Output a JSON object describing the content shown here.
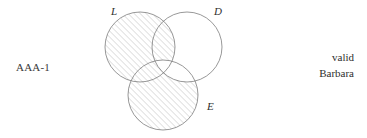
{
  "figure": {
    "left_label": "AAA-1",
    "conclusion": {
      "validity": "valid",
      "mood_figure_name": "Barbara"
    },
    "diagram": {
      "type": "three-circle-venn",
      "circles": [
        {
          "id": "L",
          "label": "L",
          "cx": 140,
          "cy": 47,
          "r": 35,
          "label_x": 111,
          "label_y": 15
        },
        {
          "id": "D",
          "label": "D",
          "cx": 187,
          "cy": 47,
          "r": 35,
          "label_x": 214,
          "label_y": 15
        },
        {
          "id": "E",
          "label": "E",
          "cx": 163,
          "cy": 95,
          "r": 35,
          "label_x": 207,
          "label_y": 110
        }
      ],
      "shaded_regions": [
        "L-only",
        "L-and-D-not-E",
        "L-and-E-not-D",
        "E-only"
      ],
      "unshaded_regions": [
        "D-only",
        "D-and-E-not-L",
        "L-and-D-and-E"
      ],
      "hatch": {
        "angle_degrees": 45,
        "spacing_px": 3,
        "color": "#9a9a9a"
      },
      "outline_color": "#6b6b6b"
    }
  }
}
